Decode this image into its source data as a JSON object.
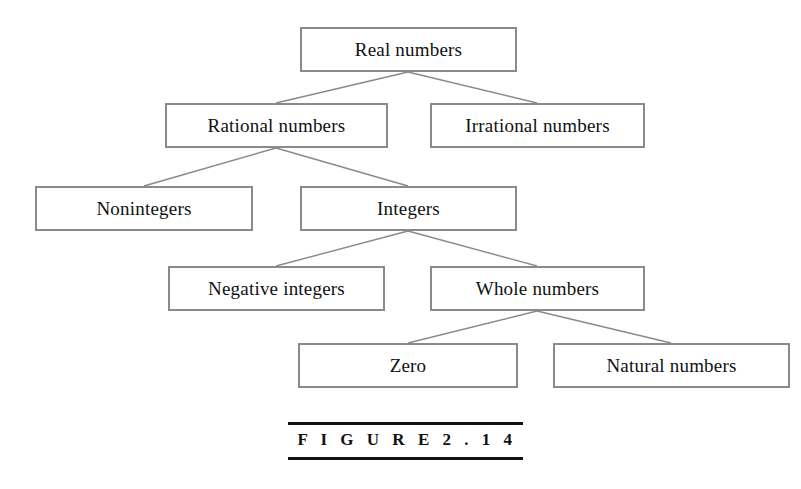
{
  "figure": {
    "caption": "F I G U R E   2 . 1 4",
    "caption_plain": "FIGURE 2.14",
    "box_border_color": "#8a8a8a",
    "edge_color": "#8a8a8a",
    "text_color": "#111111",
    "background_color": "#ffffff"
  },
  "nodes": [
    {
      "id": "real",
      "label": "Real numbers",
      "x": 300,
      "y": 27,
      "w": 217,
      "h": 45,
      "level": 1
    },
    {
      "id": "rational",
      "label": "Rational numbers",
      "x": 165,
      "y": 103,
      "w": 223,
      "h": 45,
      "level": 2
    },
    {
      "id": "irrational",
      "label": "Irrational numbers",
      "x": 430,
      "y": 103,
      "w": 215,
      "h": 45,
      "level": 2
    },
    {
      "id": "nonintegers",
      "label": "Nonintegers",
      "x": 35,
      "y": 186,
      "w": 218,
      "h": 45,
      "level": 3
    },
    {
      "id": "integers",
      "label": "Integers",
      "x": 300,
      "y": 186,
      "w": 217,
      "h": 45,
      "level": 3
    },
    {
      "id": "negative_integers",
      "label": "Negative integers",
      "x": 168,
      "y": 266,
      "w": 217,
      "h": 45,
      "level": 4
    },
    {
      "id": "whole",
      "label": "Whole numbers",
      "x": 430,
      "y": 266,
      "w": 215,
      "h": 45,
      "level": 4
    },
    {
      "id": "zero",
      "label": "Zero",
      "x": 298,
      "y": 343,
      "w": 220,
      "h": 45,
      "level": 5
    },
    {
      "id": "natural",
      "label": "Natural numbers",
      "x": 553,
      "y": 343,
      "w": 237,
      "h": 45,
      "level": 5
    }
  ],
  "edges": [
    {
      "from": "real",
      "to": "rational",
      "x1": 408,
      "y1": 72,
      "x2": 276,
      "y2": 103
    },
    {
      "from": "real",
      "to": "irrational",
      "x1": 408,
      "y1": 72,
      "x2": 537,
      "y2": 103
    },
    {
      "from": "rational",
      "to": "nonintegers",
      "x1": 276,
      "y1": 148,
      "x2": 144,
      "y2": 186
    },
    {
      "from": "rational",
      "to": "integers",
      "x1": 276,
      "y1": 148,
      "x2": 408,
      "y2": 186
    },
    {
      "from": "integers",
      "to": "negative_integers",
      "x1": 408,
      "y1": 231,
      "x2": 276,
      "y2": 266
    },
    {
      "from": "integers",
      "to": "whole",
      "x1": 408,
      "y1": 231,
      "x2": 537,
      "y2": 266
    },
    {
      "from": "whole",
      "to": "zero",
      "x1": 537,
      "y1": 311,
      "x2": 408,
      "y2": 343
    },
    {
      "from": "whole",
      "to": "natural",
      "x1": 537,
      "y1": 311,
      "x2": 671,
      "y2": 343
    }
  ]
}
